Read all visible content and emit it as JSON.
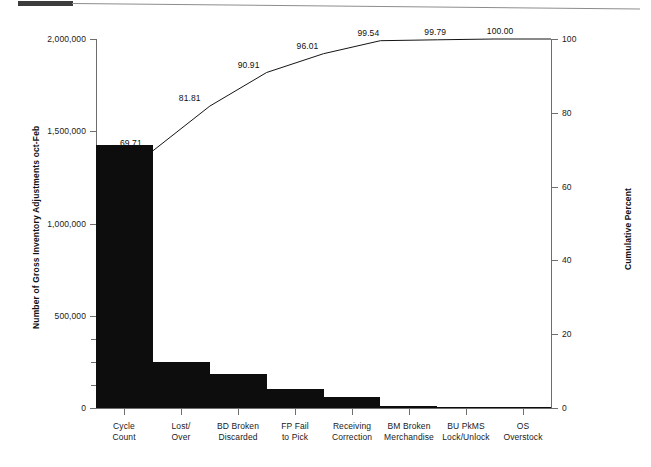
{
  "chart_data": {
    "type": "bar",
    "title": "",
    "subtitle": "",
    "xlabel": "",
    "ylabel": "Number of Gross Inventory Adjustments oct-Feb",
    "y2label": "Cumulative Percent",
    "grid": false,
    "legend": "none",
    "categories": [
      "Cycle Count",
      "Lost/ Over",
      "BD Broken Discarded",
      "FP Fail to Pick",
      "Receiving Correction",
      "BM Broken Merchandise",
      "BU PkMS Lock/Unlock",
      "OS Overstock"
    ],
    "category_lines": [
      [
        "Cycle",
        "Count"
      ],
      [
        "Lost/",
        "Over"
      ],
      [
        "BD Broken",
        "Discarded"
      ],
      [
        "FP Fail",
        "to Pick"
      ],
      [
        "Receiving",
        "Correction"
      ],
      [
        "BM Broken",
        "Merchandise"
      ],
      [
        "BU PkMS",
        "Lock/Unlock"
      ],
      [
        "OS",
        "Overstock"
      ]
    ],
    "values": [
      1428000,
      247000,
      186000,
      104000,
      60000,
      9500,
      5100,
      4300
    ],
    "cumulative_percent": [
      69.71,
      81.81,
      90.91,
      96.01,
      99.54,
      99.79,
      100.0,
      100.0
    ],
    "cumulative_labels": [
      "69.71",
      "81.81",
      "90.91",
      "96.01",
      "99.54",
      "99.79",
      "100.00"
    ],
    "ylim": [
      0,
      2000000
    ],
    "y2lim": [
      0,
      100
    ],
    "yticks": [
      0,
      500000,
      1000000,
      1500000,
      2000000
    ],
    "ytick_labels": [
      "0",
      "500,000",
      "1,000,000",
      "1,500,000",
      "2,000,000"
    ],
    "y2ticks": [
      0,
      20,
      40,
      60,
      80,
      100
    ],
    "y2tick_labels": [
      "0",
      "20",
      "40",
      "60",
      "80",
      "100"
    ],
    "bar_color": "#0d0d0d",
    "line_color": "#141414",
    "axis_color": "#6e6e6e",
    "background": "#ffffff"
  }
}
